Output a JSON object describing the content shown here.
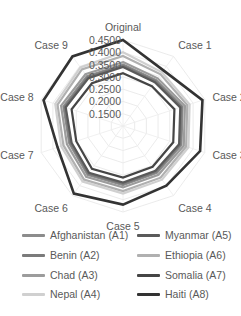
{
  "chart_data": {
    "type": "radar",
    "title": "",
    "axes": [
      "Original",
      "Case 1",
      "Case 2",
      "Case 3",
      "Case 4",
      "Case 5",
      "Case 6",
      "Case 7",
      "Case 8",
      "Case 9"
    ],
    "tick_labels": [
      "0.1500",
      "0.2000",
      "0.2500",
      "0.3000",
      "0.3500",
      "0.4000",
      "0.4500"
    ],
    "ticks": [
      0.15,
      0.2,
      0.25,
      0.3,
      0.35,
      0.4,
      0.45
    ],
    "rlim": [
      0.1,
      0.45
    ],
    "grid": true,
    "legend_position": "bottom",
    "series": [
      {
        "name": "Afghanistan (A1)",
        "color": "#8c8c8c",
        "width": 2.2,
        "values": [
          0.35,
          0.33,
          0.355,
          0.35,
          0.335,
          0.34,
          0.345,
          0.33,
          0.355,
          0.35
        ]
      },
      {
        "name": "Benin (A2)",
        "color": "#7b7b7b",
        "width": 2.2,
        "values": [
          0.345,
          0.325,
          0.35,
          0.345,
          0.33,
          0.335,
          0.34,
          0.325,
          0.35,
          0.345
        ]
      },
      {
        "name": "Chad (A3)",
        "color": "#9c9c9c",
        "width": 2.2,
        "values": [
          0.36,
          0.34,
          0.365,
          0.36,
          0.345,
          0.35,
          0.355,
          0.34,
          0.365,
          0.36
        ]
      },
      {
        "name": "Nepal (A4)",
        "color": "#d0d0d0",
        "width": 2.2,
        "values": [
          0.4,
          0.37,
          0.385,
          0.38,
          0.37,
          0.375,
          0.38,
          0.365,
          0.39,
          0.395
        ]
      },
      {
        "name": "Myanmar (A5)",
        "color": "#5a5a5a",
        "width": 2.2,
        "values": [
          0.34,
          0.32,
          0.345,
          0.34,
          0.325,
          0.33,
          0.335,
          0.32,
          0.345,
          0.34
        ]
      },
      {
        "name": "Ethiopia (A6)",
        "color": "#b0b0b0",
        "width": 2.2,
        "values": [
          0.385,
          0.36,
          0.375,
          0.37,
          0.36,
          0.365,
          0.37,
          0.355,
          0.38,
          0.385
        ]
      },
      {
        "name": "Somalia (A7)",
        "color": "#454545",
        "width": 2.2,
        "values": [
          0.315,
          0.3,
          0.32,
          0.315,
          0.305,
          0.31,
          0.315,
          0.3,
          0.32,
          0.315
        ]
      },
      {
        "name": "Haiti (A8)",
        "color": "#333333",
        "width": 2.6,
        "values": [
          0.45,
          0.38,
          0.44,
          0.43,
          0.4,
          0.42,
          0.44,
          0.38,
          0.44,
          0.45
        ]
      }
    ]
  },
  "legend": {
    "items": [
      {
        "label": "Afghanistan (A1)",
        "color": "#8c8c8c"
      },
      {
        "label": "Benin (A2)",
        "color": "#7b7b7b"
      },
      {
        "label": "Chad (A3)",
        "color": "#9c9c9c"
      },
      {
        "label": "Nepal (A4)",
        "color": "#d0d0d0"
      },
      {
        "label": "Myanmar (A5)",
        "color": "#5a5a5a"
      },
      {
        "label": "Ethiopia (A6)",
        "color": "#b0b0b0"
      },
      {
        "label": "Somalia (A7)",
        "color": "#454545"
      },
      {
        "label": "Haiti (A8)",
        "color": "#333333"
      }
    ]
  }
}
